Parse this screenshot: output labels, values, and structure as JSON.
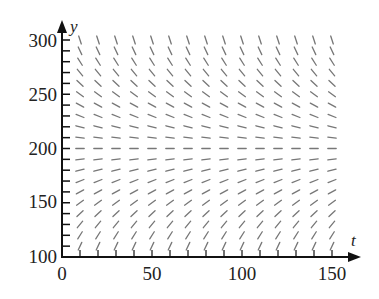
{
  "chart_data": {
    "type": "slope_field",
    "title": "",
    "xlabel": "t",
    "ylabel": "y",
    "xlim": [
      0,
      150
    ],
    "ylim": [
      100,
      300
    ],
    "x_ticks": [
      0,
      50,
      100,
      150
    ],
    "y_ticks": [
      100,
      150,
      200,
      250,
      300
    ],
    "y_minor_tick_step": 10,
    "grid": false,
    "legend": null,
    "equilibrium": 200,
    "sample_t": [
      10,
      20,
      30,
      40,
      50,
      60,
      70,
      80,
      90,
      100,
      110,
      120,
      130,
      140,
      150
    ],
    "sample_y": [
      100,
      110,
      120,
      130,
      140,
      150,
      160,
      170,
      180,
      190,
      200,
      210,
      220,
      230,
      240,
      250,
      260,
      270,
      280,
      290,
      300
    ],
    "slope_model": "dy/dt = k*(200 - y)",
    "segment_color": "#777777"
  },
  "axes": {
    "x_label": "t",
    "y_label": "y",
    "x_tick_labels": [
      "0",
      "50",
      "100",
      "150"
    ],
    "y_tick_labels": [
      "100",
      "150",
      "200",
      "250",
      "300"
    ]
  }
}
